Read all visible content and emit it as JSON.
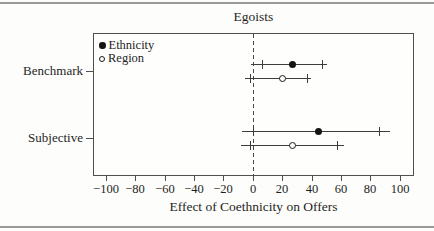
{
  "chart_data": {
    "type": "scatter",
    "variant": "forest-plot-horizontal",
    "title": "Egoists",
    "xlabel": "Effect of Coethnicity on Offers",
    "xlim": [
      -108,
      109
    ],
    "x_ticks": [
      -100,
      -80,
      -60,
      -40,
      -20,
      0,
      20,
      40,
      60,
      80,
      100
    ],
    "x_tick_labels": [
      "−100",
      "−80",
      "−60",
      "−40",
      "−20",
      "0",
      "20",
      "40",
      "60",
      "80",
      "100"
    ],
    "zero_reference_line": 0,
    "grid": false,
    "legend": [
      {
        "name": "Ethnicity",
        "marker": "filled-circle"
      },
      {
        "name": "Region",
        "marker": "open-circle"
      }
    ],
    "legend_position": "top-left-inside",
    "groups": [
      {
        "label": "Benchmark",
        "rows": [
          {
            "series": "Ethnicity",
            "marker": "filled-circle",
            "point": 27,
            "inner_interval": [
              6,
              47
            ],
            "outer_interval": [
              -1,
              51
            ]
          },
          {
            "series": "Region",
            "marker": "open-circle",
            "point": 20,
            "inner_interval": [
              -2,
              37
            ],
            "outer_interval": [
              -5,
              40
            ]
          }
        ]
      },
      {
        "label": "Subjective",
        "rows": [
          {
            "series": "Ethnicity",
            "marker": "filled-circle",
            "point": 45,
            "inner_interval": [
              0,
              86
            ],
            "outer_interval": [
              -7,
              94
            ]
          },
          {
            "series": "Region",
            "marker": "open-circle",
            "point": 27,
            "inner_interval": [
              -2,
              57
            ],
            "outer_interval": [
              -8,
              62
            ]
          }
        ]
      }
    ]
  }
}
